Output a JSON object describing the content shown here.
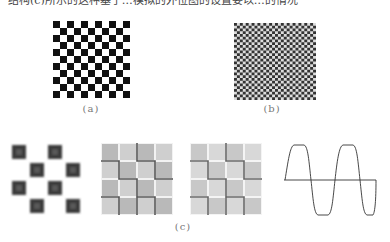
{
  "page": {
    "top_text": "结构(c)所示的这种基于…模拟的外位图的设置要以…的情况"
  },
  "figure": {
    "panels": [
      {
        "id": "a",
        "caption": "(a)",
        "description": "coarse checkerboard pattern",
        "grid_cells": 11,
        "colors": {
          "dark": "#111111",
          "light": "#ffffff"
        }
      },
      {
        "id": "b",
        "caption": "(b)",
        "description": "fine checkerboard pattern",
        "grid_cells": 28,
        "colors": {
          "dark": "#333333",
          "light": "#dddddd"
        }
      },
      {
        "id": "c",
        "caption": "(c)",
        "subpanels": [
          {
            "description": "blurred checkerboard squares",
            "grid_cells": 4,
            "colors": {
              "dark": "#3a3a3a",
              "inner": "#666666",
              "light": "#ffffff"
            }
          },
          {
            "description": "gray tile grid with dark edge lines",
            "grid_cells": 4,
            "colors": {
              "tile": "#b9b9b9",
              "tile_light": "#cfcfcf",
              "gap": "#f2f2f2",
              "edge": "#555555"
            }
          },
          {
            "description": "gray tile grid with dark edge lines (variant)",
            "grid_cells": 4,
            "colors": {
              "tile": "#c8c8c8",
              "tile_light": "#d8d8d8",
              "gap": "#f4f4f4",
              "edge": "#666666"
            }
          },
          {
            "description": "clipped sine waveform with horizontal axis",
            "colors": {
              "line": "#333333"
            }
          }
        ]
      }
    ]
  }
}
